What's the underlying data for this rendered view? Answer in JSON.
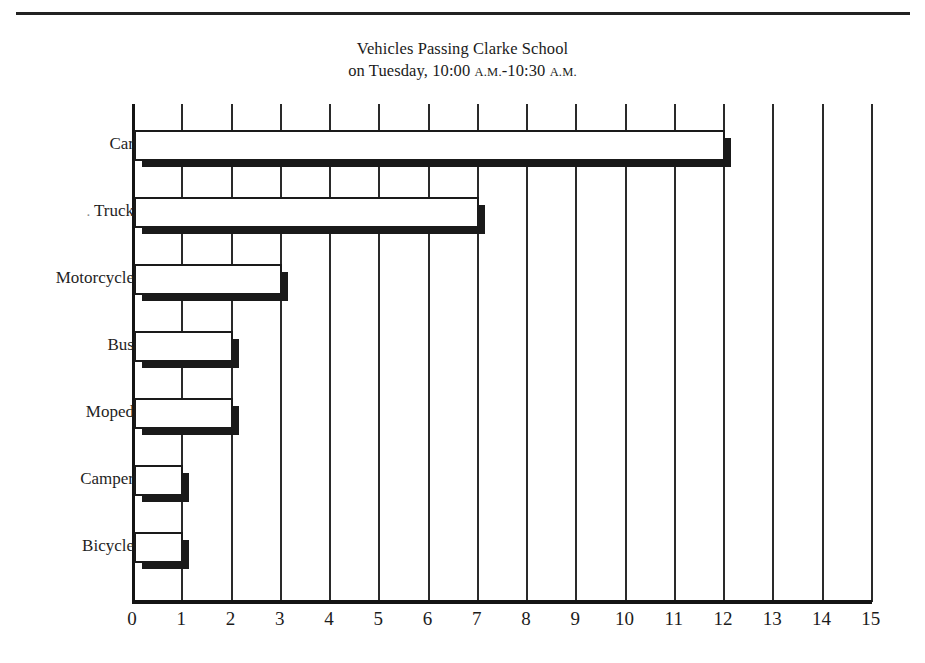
{
  "chart_data": {
    "type": "bar",
    "orientation": "horizontal",
    "title": "Vehicles Passing Clarke School",
    "subtitle": "on Tuesday, 10:00 A.M.-10:30 A.M.",
    "title_line1": "Vehicles Passing Clarke School",
    "title_line2_prefix": "on Tuesday, 10:00 ",
    "title_line2_am1": "A.M.",
    "title_line2_mid": "-10:30 ",
    "title_line2_am2": "A.M.",
    "categories": [
      "Car",
      "Truck",
      "Motorcycle",
      "Bus",
      "Moped",
      "Camper",
      "Bicycle"
    ],
    "category_labels": [
      "Car",
      ". Truck",
      "Motorcycle",
      "Bus",
      "Moped",
      "Camper",
      "Bicycle"
    ],
    "values": [
      12,
      7,
      3,
      2,
      2,
      1,
      1
    ],
    "xlabel": "",
    "ylabel": "",
    "xlim": [
      0,
      15
    ],
    "xticks": [
      "0",
      "1",
      "2",
      "3",
      "4",
      "5",
      "6",
      "7",
      "8",
      "9",
      "10",
      "11",
      "12",
      "13",
      "14",
      "15"
    ],
    "grid": true,
    "grid_orientation": "vertical",
    "legend": null,
    "colors": {
      "bar_fill": "#ffffff",
      "bar_outline": "#1a1a1a",
      "bar_shadow": "#1a1a1a",
      "grid": "#2a2a2a",
      "axis": "#141414",
      "text": "#1b1b1b",
      "background": "#ffffff"
    }
  }
}
